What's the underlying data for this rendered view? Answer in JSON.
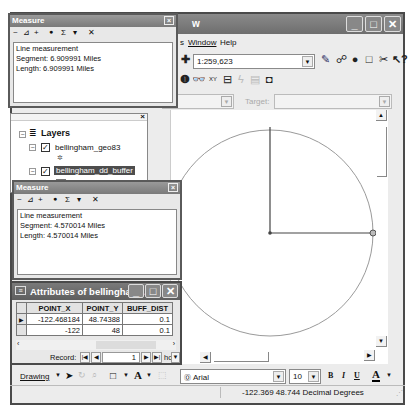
{
  "main_window": {
    "title_fragment": "w",
    "controls": {
      "minimize": "_",
      "maximize": "□",
      "close": "✕"
    },
    "menu": [
      {
        "label": "s"
      },
      {
        "label": "Window"
      },
      {
        "label": "Help"
      }
    ],
    "toolbar": {
      "scale_value": "1:259,623",
      "icons": [
        "add-data-icon",
        "editor-toolbar-icon",
        "arctoc-icon",
        "arccatalog-icon",
        "layout-icon",
        "script-icon",
        "whats-this-icon"
      ]
    },
    "tools_row": {
      "icons": [
        "identify-icon",
        "find-icon",
        "go-to-xy-icon",
        "measure-icon",
        "hyperlink-icon",
        "html-popup-icon",
        "time-slider-icon"
      ]
    },
    "editor_row": {
      "task_value": "te",
      "target_label": "Target:",
      "target_value": ""
    }
  },
  "measure_top": {
    "title": "Measure",
    "tools": [
      "~",
      "⊿",
      "+",
      "●",
      "Σ",
      "▾",
      "✕"
    ],
    "lines": [
      "Line measurement",
      "Segment: 6.909991 Miles",
      "Length: 6.909991 Miles"
    ]
  },
  "measure_bottom": {
    "title": "Measure",
    "tools": [
      "~",
      "⊿",
      "+",
      "●",
      "Σ",
      "▾",
      "✕"
    ],
    "lines": [
      "Line measurement",
      "Segment: 4.570014 Miles",
      "Length: 4.570014 Miles"
    ]
  },
  "toc": {
    "root_label": "Layers",
    "layers": [
      {
        "name": "bellingham_geo83",
        "checked": true,
        "selected": false,
        "symbol": "point"
      },
      {
        "name": "bellingham_dd_buffer",
        "checked": true,
        "selected": true,
        "symbol": "polygon"
      }
    ]
  },
  "attributes": {
    "title": "Attributes of bellingham...",
    "columns": [
      "POINT_X",
      "POINT_Y",
      "BUFF_DIST"
    ],
    "rows": [
      {
        "POINT_X": "-122.468184",
        "POINT_Y": "48.74388",
        "BUFF_DIST": "0.1",
        "current": true
      },
      {
        "POINT_X": "-122",
        "POINT_Y": "48",
        "BUFF_DIST": "0.1",
        "current": false
      }
    ],
    "record_label": "Record:",
    "record_value": "1",
    "show_label": "how:"
  },
  "drawing_toolbar": {
    "drawing_label": "Drawing",
    "font_value": "Arial",
    "font_size_value": "10",
    "bold": "B",
    "italic": "I",
    "underline": "U",
    "font_color": "A"
  },
  "status_bar": {
    "coordinates": "-122.369  48.744 Decimal Degrees"
  },
  "map": {
    "circle_color": "#9a9a9a",
    "line_color": "#444444"
  }
}
